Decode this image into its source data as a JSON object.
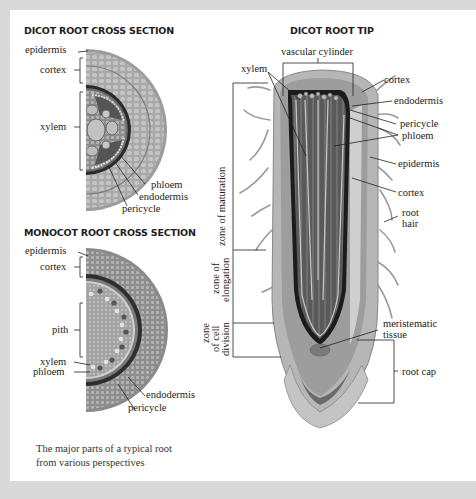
{
  "dicot_cross_section": {
    "title": "DICOT ROOT CROSS SECTION",
    "labels": {
      "epidermis": "epidermis",
      "cortex": "cortex",
      "xylem": "xylem",
      "phloem": "phloem",
      "endodermis": "endodermis",
      "pericycle": "pericycle"
    }
  },
  "monocot_cross_section": {
    "title": "MONOCOT ROOT CROSS SECTION",
    "labels": {
      "epidermis": "epidermis",
      "cortex": "cortex",
      "pith": "pith",
      "xylem": "xylem",
      "phloem": "phloem",
      "endodermis": "endodermis",
      "pericycle": "pericycle"
    }
  },
  "dicot_root_tip": {
    "title": "DICOT ROOT TIP",
    "labels": {
      "vascular_cylinder": "vascular cylinder",
      "xylem": "xylem",
      "cortex_top": "cortex",
      "endodermis": "endodermis",
      "pericycle": "pericycle",
      "phloem": "phloem",
      "epidermis": "epidermis",
      "cortex": "cortex",
      "root_hair_1": "root",
      "root_hair_2": "hair",
      "meristematic_1": "meristematic",
      "meristematic_2": "tissue",
      "root_cap": "root cap"
    },
    "zones": {
      "maturation": "zone of maturation",
      "elongation_1": "zone of",
      "elongation_2": "elongation",
      "division_1": "zone",
      "division_2": "of cell",
      "division_3": "division"
    }
  },
  "caption": {
    "line1": "The major parts of a typical root",
    "line2": "from various perspectives"
  },
  "colors": {
    "background": "#d9d9d9",
    "card": "#ffffff",
    "tissue_light": "#c9c9c9",
    "tissue_mid": "#9a9a9a",
    "tissue_dark": "#4a4a4a"
  }
}
